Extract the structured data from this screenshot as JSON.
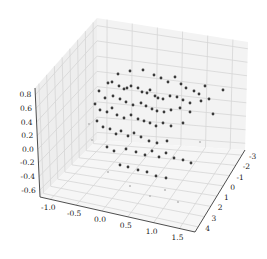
{
  "chart_data": {
    "type": "scatter",
    "dimensions": "3d",
    "title": "",
    "xlabel": "",
    "ylabel": "",
    "zlabel": "",
    "x_ticks": [
      "-1.0",
      "-0.5",
      "0.0",
      "0.5",
      "1.0",
      "1.5"
    ],
    "y_ticks": [
      "-3",
      "-2",
      "-1",
      "0",
      "1",
      "2",
      "3",
      "4"
    ],
    "z_ticks": [
      "0.8",
      "0.6",
      "0.4",
      "0.2",
      "0.0",
      "-0.2",
      "-0.4",
      "-0.6"
    ],
    "xlim": [
      -1.25,
      1.6
    ],
    "ylim": [
      -3.3,
      4.3
    ],
    "zlim": [
      -0.7,
      0.9
    ],
    "grid": true,
    "legend": null,
    "marker_color": "#3a3a3a",
    "pane_color": "#f2f2f2",
    "grid_color": "#d6d6d6",
    "points_screen": [
      [
        118,
        74
      ],
      [
        130,
        71
      ],
      [
        143,
        70
      ],
      [
        154,
        75
      ],
      [
        161,
        78
      ],
      [
        168,
        82
      ],
      [
        175,
        77
      ],
      [
        181,
        84
      ],
      [
        186,
        88
      ],
      [
        194,
        91
      ],
      [
        199,
        94
      ],
      [
        205,
        86
      ],
      [
        223,
        90
      ],
      [
        108,
        83
      ],
      [
        112,
        82
      ],
      [
        119,
        86
      ],
      [
        124,
        89
      ],
      [
        127,
        88
      ],
      [
        131,
        86
      ],
      [
        138,
        88
      ],
      [
        142,
        92
      ],
      [
        147,
        93
      ],
      [
        150,
        90
      ],
      [
        155,
        96
      ],
      [
        158,
        98
      ],
      [
        163,
        99
      ],
      [
        170,
        96
      ],
      [
        177,
        97
      ],
      [
        183,
        100
      ],
      [
        190,
        103
      ],
      [
        201,
        101
      ],
      [
        209,
        99
      ],
      [
        99,
        91
      ],
      [
        105,
        98
      ],
      [
        113,
        96
      ],
      [
        120,
        99
      ],
      [
        126,
        102
      ],
      [
        133,
        105
      ],
      [
        141,
        103
      ],
      [
        146,
        106
      ],
      [
        152,
        109
      ],
      [
        157,
        111
      ],
      [
        164,
        112
      ],
      [
        171,
        110
      ],
      [
        180,
        108
      ],
      [
        190,
        112
      ],
      [
        213,
        114
      ],
      [
        95,
        104
      ],
      [
        100,
        110
      ],
      [
        107,
        112
      ],
      [
        112,
        108
      ],
      [
        117,
        115
      ],
      [
        124,
        118
      ],
      [
        131,
        115
      ],
      [
        138,
        119
      ],
      [
        144,
        121
      ],
      [
        150,
        123
      ],
      [
        156,
        126
      ],
      [
        163,
        123
      ],
      [
        171,
        126
      ],
      [
        183,
        123
      ],
      [
        97,
        121
      ],
      [
        103,
        127
      ],
      [
        110,
        129
      ],
      [
        116,
        134
      ],
      [
        121,
        131
      ],
      [
        128,
        136
      ],
      [
        134,
        133
      ],
      [
        141,
        137
      ],
      [
        149,
        141
      ],
      [
        157,
        143
      ],
      [
        167,
        141
      ],
      [
        107,
        147
      ],
      [
        114,
        151
      ],
      [
        126,
        149
      ],
      [
        136,
        152
      ],
      [
        145,
        155
      ],
      [
        152,
        151
      ],
      [
        159,
        157
      ],
      [
        166,
        153
      ],
      [
        174,
        158
      ],
      [
        183,
        160
      ],
      [
        191,
        163
      ],
      [
        120,
        165
      ],
      [
        128,
        167
      ],
      [
        138,
        170
      ],
      [
        147,
        172
      ],
      [
        156,
        176
      ],
      [
        166,
        178
      ]
    ],
    "faint_points_screen": [
      [
        89,
        124
      ],
      [
        92,
        140
      ],
      [
        165,
        190
      ],
      [
        178,
        202
      ],
      [
        130,
        186
      ],
      [
        150,
        196
      ],
      [
        108,
        172
      ],
      [
        200,
        142
      ]
    ]
  }
}
